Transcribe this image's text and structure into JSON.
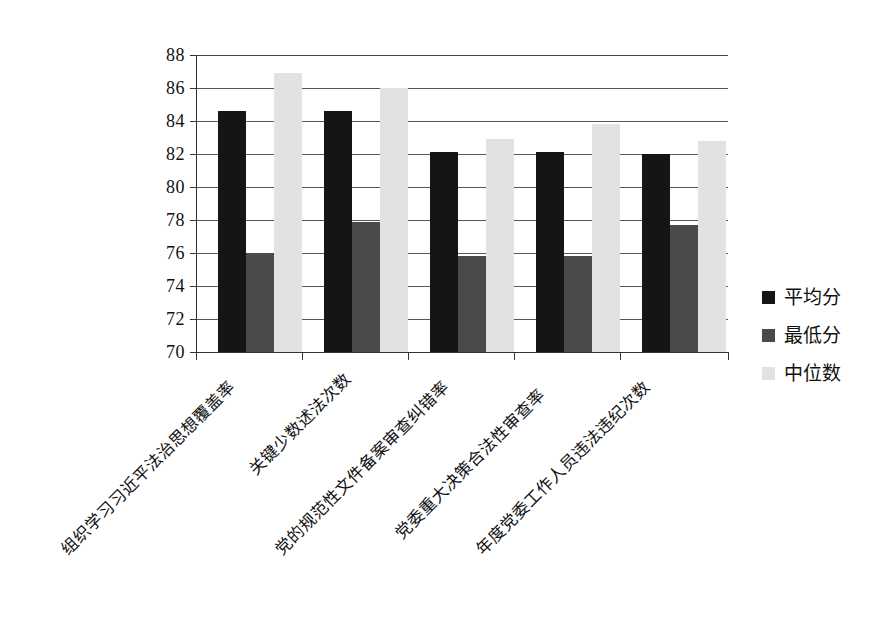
{
  "chart_data": {
    "type": "bar",
    "title": "",
    "subtitle": "",
    "xlabel": "",
    "ylabel": "",
    "ylim": [
      70,
      88
    ],
    "ytick_step": 2,
    "yticks": [
      "88",
      "86",
      "84",
      "82",
      "80",
      "78",
      "76",
      "74",
      "72",
      "70"
    ],
    "grid": true,
    "legend_position": "right",
    "categories": [
      "组织学习习近平法治思想覆盖率",
      "关键少数述法次数",
      "党的规范性文件备案审查纠错率",
      "党委重大决策合法性审查率",
      "年度党委工作人员违法违纪次数"
    ],
    "series": [
      {
        "name": "平均分",
        "color": "#151515",
        "values": [
          84.6,
          84.6,
          82.1,
          82.1,
          82.0
        ]
      },
      {
        "name": "最低分",
        "color": "#4a4a4a",
        "values": [
          76.0,
          77.9,
          75.8,
          75.8,
          77.7
        ]
      },
      {
        "name": "中位数",
        "color": "#e2e2e2",
        "values": [
          86.9,
          86.0,
          82.9,
          83.8,
          82.8
        ]
      }
    ]
  },
  "legend": {
    "items": [
      {
        "label": "平均分"
      },
      {
        "label": "最低分"
      },
      {
        "label": "中位数"
      }
    ]
  },
  "axis": {
    "y_labels": [
      "88",
      "86",
      "84",
      "82",
      "80",
      "78",
      "76",
      "74",
      "72",
      "70"
    ]
  }
}
